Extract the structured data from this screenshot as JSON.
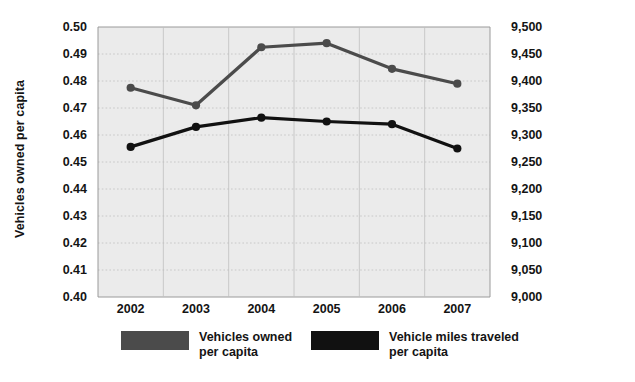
{
  "chart_data": {
    "type": "line",
    "title": "",
    "xlabel": "",
    "categories": [
      "2002",
      "2003",
      "2004",
      "2005",
      "2006",
      "2007"
    ],
    "grid": true,
    "legend_position": "bottom",
    "axes": {
      "left": {
        "label": "Vehicles owned per capita",
        "ylim": [
          0.4,
          0.5
        ],
        "tick_step": 0.01,
        "ticks": [
          "0.50",
          "0.49",
          "0.48",
          "0.47",
          "0.46",
          "0.45",
          "0.44",
          "0.43",
          "0.42",
          "0.41",
          "0.40"
        ],
        "tick_values": [
          0.5,
          0.49,
          0.48,
          0.47,
          0.46,
          0.45,
          0.44,
          0.43,
          0.42,
          0.41,
          0.4
        ]
      },
      "right": {
        "label": "Annual vehicle miles traveled per capita",
        "ylim": [
          9000,
          9500
        ],
        "tick_step": 50,
        "ticks": [
          "9,500",
          "9,450",
          "9,400",
          "9,350",
          "9,300",
          "9,250",
          "9,200",
          "9,150",
          "9,100",
          "9,050",
          "9,000"
        ],
        "tick_values": [
          9500,
          9450,
          9400,
          9350,
          9300,
          9250,
          9200,
          9150,
          9100,
          9050,
          9000
        ]
      }
    },
    "series": [
      {
        "name": "Vehicles owned per capita",
        "axis": "left",
        "color": "#4b4b4b",
        "values": [
          0.4775,
          0.471,
          0.4925,
          0.494,
          0.4845,
          0.479
        ]
      },
      {
        "name": "Vehicle miles traveled per capita",
        "axis": "right",
        "color": "#111111",
        "values": [
          9278,
          9315,
          9332,
          9325,
          9320,
          9275
        ]
      }
    ]
  },
  "legend": {
    "items": [
      {
        "label": "Vehicles owned\nper capita",
        "color": "#4b4b4b"
      },
      {
        "label": "Vehicle miles traveled\nper capita",
        "color": "#111111"
      }
    ]
  },
  "colors": {
    "plot_background": "#ebebeb",
    "page_background": "#ffffff",
    "gridline": "#bfbfbf",
    "axis_line": "#9a9a9a",
    "text": "#141414"
  }
}
